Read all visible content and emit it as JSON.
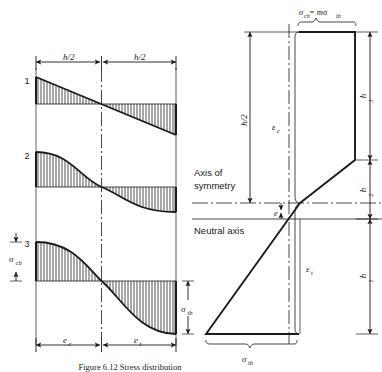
{
  "figure": {
    "caption": "Figure 6.12  Stress distribution",
    "background_color": "#ffffff",
    "line_color": "#1a1a1a"
  },
  "left_panel": {
    "title_dims": [
      {
        "label": "h/2"
      },
      {
        "label": "h/2"
      }
    ],
    "curve_labels": [
      {
        "label": "1"
      },
      {
        "label": "2"
      },
      {
        "label": "3"
      }
    ],
    "stress_labels": [
      {
        "label": "σ",
        "sub": "cb"
      },
      {
        "label": "σ",
        "sub": "tb"
      }
    ],
    "bottom_dims": [
      {
        "label": "e",
        "sub": "c"
      },
      {
        "label": "e",
        "sub": "t"
      }
    ]
  },
  "right_panel": {
    "top_label": {
      "text": "σ",
      "sub": "cb",
      "eq": " = mσ",
      "sub2": "tb"
    },
    "height_labels": [
      {
        "label": "h/2"
      },
      {
        "label": "h",
        "sub": "3"
      },
      {
        "label": "h",
        "sub": "2"
      },
      {
        "label": "h",
        "sub": "1"
      }
    ],
    "strain_labels": [
      {
        "label": "ε",
        "sub": "c"
      },
      {
        "label": "ε",
        "sub": "t"
      }
    ],
    "eccentricity_label": {
      "label": "e"
    },
    "axis_labels": [
      {
        "line1": "Axis of",
        "line2": "symmetry"
      },
      {
        "line1": "Neutral axis",
        "line2": ""
      }
    ],
    "bottom_stress": {
      "label": "σ",
      "sub": "tb"
    }
  }
}
